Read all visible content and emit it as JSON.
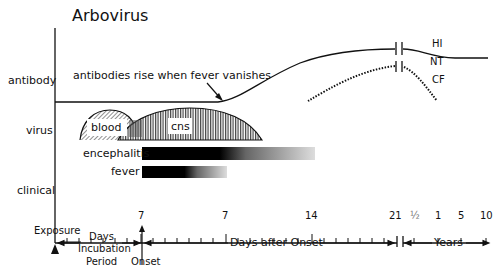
{
  "title": "Arbovirus",
  "row_labels": {
    "antibody": "antibody",
    "virus": "virus",
    "clinical": "clinical"
  },
  "annotation": "antibodies rise when fever vanishes",
  "curves": {
    "hi": "HI",
    "nt": "NT",
    "cf": "CF"
  },
  "virus_phases": {
    "blood": "blood",
    "cns": "cns"
  },
  "clinical_bars": {
    "encephalitis": "encephalitis",
    "fever": "fever"
  },
  "x_ticks": [
    "7",
    "7",
    "14",
    "21",
    "½",
    "1",
    "5",
    "10"
  ],
  "bottom_labels": {
    "exposure": "Exposure",
    "incubation_line1": "Days",
    "incubation_line2": "Incubation",
    "incubation_line3": "Period",
    "onset": "Onset",
    "days_after_onset": "Days after Onset",
    "years": "Years"
  }
}
